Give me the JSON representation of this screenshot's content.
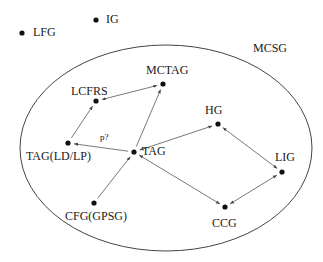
{
  "diagram": {
    "region": {
      "label": "MCSG",
      "cx": 166,
      "cy": 148,
      "rx": 146,
      "ry": 103
    },
    "nodes": [
      {
        "id": "LFG",
        "label": "LFG",
        "x": 22,
        "y": 33,
        "lx": 33,
        "ly": 26
      },
      {
        "id": "IG",
        "label": "IG",
        "x": 96,
        "y": 20,
        "lx": 106,
        "ly": 13
      },
      {
        "id": "MCTAG",
        "label": "MCTAG",
        "x": 163,
        "y": 84,
        "lx": 146,
        "ly": 64
      },
      {
        "id": "LCFRS",
        "label": "LCFRS",
        "x": 96,
        "y": 101,
        "lx": 71,
        "ly": 85
      },
      {
        "id": "HG",
        "label": "HG",
        "x": 218,
        "y": 124,
        "lx": 205,
        "ly": 104
      },
      {
        "id": "TAG_LDLP",
        "label": "TAG(LD/LP)",
        "x": 68,
        "y": 143,
        "lx": 26,
        "ly": 150
      },
      {
        "id": "TAG",
        "label": "TAG",
        "x": 134,
        "y": 152,
        "lx": 142,
        "ly": 145
      },
      {
        "id": "LIG",
        "label": "LIG",
        "x": 282,
        "y": 172,
        "lx": 275,
        "ly": 151
      },
      {
        "id": "CFG",
        "label": "CFG(GPSG)",
        "x": 94,
        "y": 203,
        "lx": 65,
        "ly": 210
      },
      {
        "id": "CCG",
        "label": "CCG",
        "x": 225,
        "y": 207,
        "lx": 212,
        "ly": 217
      }
    ],
    "edges": [
      {
        "from": "TAG",
        "to": "MCTAG",
        "type": "directed"
      },
      {
        "from": "MCTAG",
        "to": "LCFRS",
        "type": "bidirectional"
      },
      {
        "from": "TAG_LDLP",
        "to": "LCFRS",
        "type": "directed"
      },
      {
        "from": "TAG",
        "to": "TAG_LDLP",
        "type": "directed",
        "label": "p?"
      },
      {
        "from": "CFG",
        "to": "TAG",
        "type": "directed"
      },
      {
        "from": "TAG",
        "to": "HG",
        "type": "bidirectional"
      },
      {
        "from": "TAG",
        "to": "CCG",
        "type": "bidirectional"
      },
      {
        "from": "HG",
        "to": "LIG",
        "type": "bidirectional"
      },
      {
        "from": "CCG",
        "to": "LIG",
        "type": "bidirectional"
      }
    ],
    "edge_label": {
      "text": "p?",
      "x": 100,
      "y": 131
    },
    "colors": {
      "ink": "#1a1a1a",
      "line": "#555555",
      "background": "#ffffff"
    }
  }
}
